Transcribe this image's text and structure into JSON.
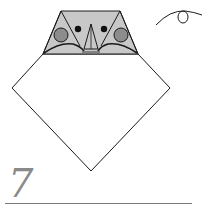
{
  "diagram": {
    "step": {
      "number": "7"
    },
    "instruction_symbols": [
      {
        "type": "turn-over-arrow",
        "position": "top-right"
      }
    ],
    "colors": {
      "paper_back": "#c8c8c8",
      "paper_front": "#ffffff",
      "cheek": "#8c8c8c",
      "eye": "#111111",
      "line": "#1a1a1a",
      "step_number": "#8a8a8a",
      "rule": "#7a7a7a"
    },
    "parts": {
      "head": "trapezoid (shaded)",
      "eyes": 2,
      "cheeks": 2,
      "beak": "triangle",
      "body": "diamond (white)"
    }
  }
}
